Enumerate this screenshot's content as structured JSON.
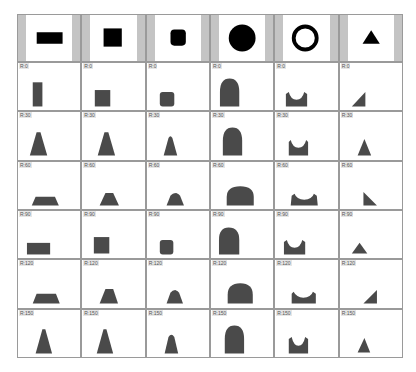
{
  "header": {
    "shapes": [
      {
        "name": "rectangle",
        "label": "rectangle"
      },
      {
        "name": "square",
        "label": "square"
      },
      {
        "name": "rounded-square",
        "label": "rounded square"
      },
      {
        "name": "circle",
        "label": "circle"
      },
      {
        "name": "ring",
        "label": "ring"
      },
      {
        "name": "triangle",
        "label": "triangle"
      }
    ]
  },
  "rows": [
    {
      "label": "R:0"
    },
    {
      "label": "R:30"
    },
    {
      "label": "R:60"
    },
    {
      "label": "R:90"
    },
    {
      "label": "R:120"
    },
    {
      "label": "R:150"
    }
  ],
  "colors": {
    "header_shape": "#000000",
    "silhouette": "#4a4a4a",
    "border": "#9a9a9a",
    "side_bar": "#c4c4c4"
  }
}
